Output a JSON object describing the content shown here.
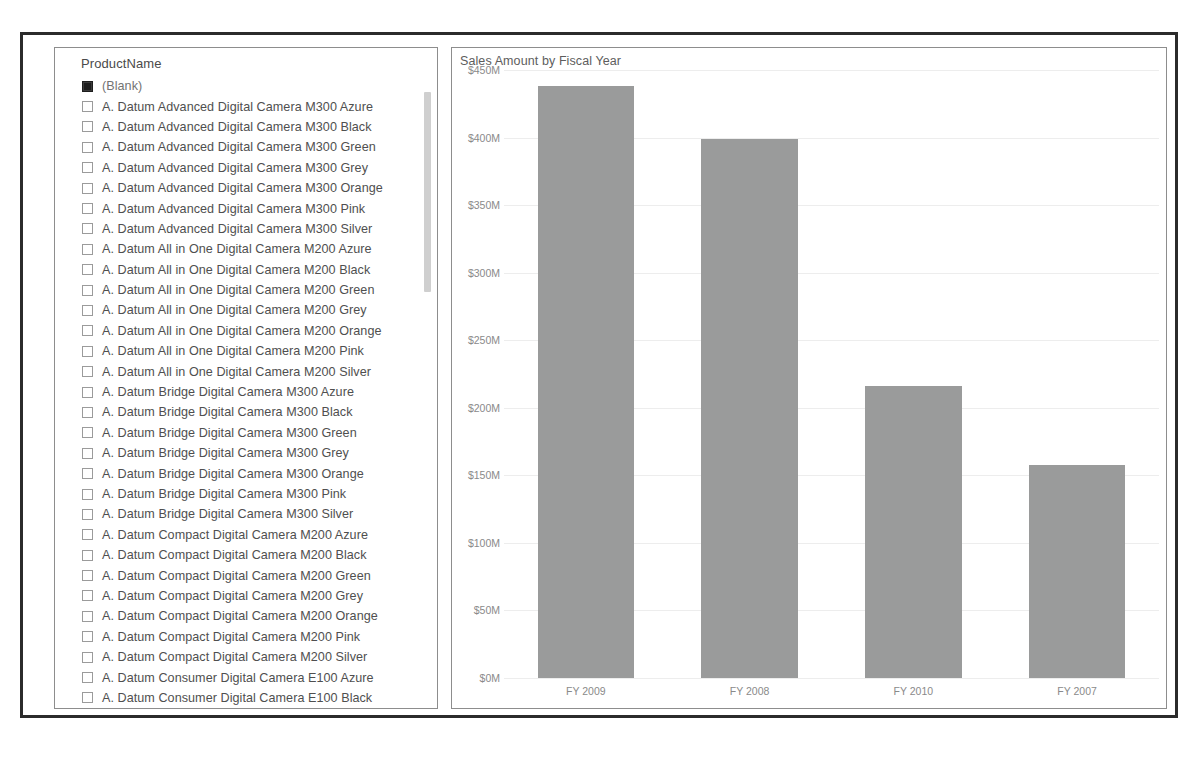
{
  "report": {
    "slicer": {
      "header": "ProductName",
      "scrollbar_name": "vertical-scrollbar",
      "items": [
        {
          "label": "(Blank)",
          "checked": true
        },
        {
          "label": "A. Datum Advanced Digital Camera M300 Azure",
          "checked": false
        },
        {
          "label": "A. Datum Advanced Digital Camera M300 Black",
          "checked": false
        },
        {
          "label": "A. Datum Advanced Digital Camera M300 Green",
          "checked": false
        },
        {
          "label": "A. Datum Advanced Digital Camera M300 Grey",
          "checked": false
        },
        {
          "label": "A. Datum Advanced Digital Camera M300 Orange",
          "checked": false
        },
        {
          "label": "A. Datum Advanced Digital Camera M300 Pink",
          "checked": false
        },
        {
          "label": "A. Datum Advanced Digital Camera M300 Silver",
          "checked": false
        },
        {
          "label": "A. Datum All in One Digital Camera M200 Azure",
          "checked": false
        },
        {
          "label": "A. Datum All in One Digital Camera M200 Black",
          "checked": false
        },
        {
          "label": "A. Datum All in One Digital Camera M200 Green",
          "checked": false
        },
        {
          "label": "A. Datum All in One Digital Camera M200 Grey",
          "checked": false
        },
        {
          "label": "A. Datum All in One Digital Camera M200 Orange",
          "checked": false
        },
        {
          "label": "A. Datum All in One Digital Camera M200 Pink",
          "checked": false
        },
        {
          "label": "A. Datum All in One Digital Camera M200 Silver",
          "checked": false
        },
        {
          "label": "A. Datum Bridge Digital Camera M300 Azure",
          "checked": false
        },
        {
          "label": "A. Datum Bridge Digital Camera M300 Black",
          "checked": false
        },
        {
          "label": "A. Datum Bridge Digital Camera M300 Green",
          "checked": false
        },
        {
          "label": "A. Datum Bridge Digital Camera M300 Grey",
          "checked": false
        },
        {
          "label": "A. Datum Bridge Digital Camera M300 Orange",
          "checked": false
        },
        {
          "label": "A. Datum Bridge Digital Camera M300 Pink",
          "checked": false
        },
        {
          "label": "A. Datum Bridge Digital Camera M300 Silver",
          "checked": false
        },
        {
          "label": "A. Datum Compact Digital Camera M200 Azure",
          "checked": false
        },
        {
          "label": "A. Datum Compact Digital Camera M200 Black",
          "checked": false
        },
        {
          "label": "A. Datum Compact Digital Camera M200 Green",
          "checked": false
        },
        {
          "label": "A. Datum Compact Digital Camera M200 Grey",
          "checked": false
        },
        {
          "label": "A. Datum Compact Digital Camera M200 Orange",
          "checked": false
        },
        {
          "label": "A. Datum Compact Digital Camera M200 Pink",
          "checked": false
        },
        {
          "label": "A. Datum Compact Digital Camera M200 Silver",
          "checked": false
        },
        {
          "label": "A. Datum Consumer Digital Camera E100 Azure",
          "checked": false
        },
        {
          "label": "A. Datum Consumer Digital Camera E100 Black",
          "checked": false
        },
        {
          "label": "A. Datum Consumer Digital Camera E100 Green",
          "checked": false
        }
      ]
    }
  },
  "colors": {
    "bar_fill": "#9a9b9b",
    "gridline": "#ededed",
    "axis_text": "#8a8a8a",
    "panel_border": "#8d8d8d",
    "frame_border": "#2b2b2b",
    "checkbox_checked": "#1d1d1d"
  },
  "chart_data": {
    "type": "bar",
    "title": "Sales Amount by Fiscal Year",
    "xlabel": "",
    "ylabel": "",
    "categories": [
      "FY 2009",
      "FY 2008",
      "FY 2010",
      "FY 2007"
    ],
    "values": [
      438,
      399,
      216,
      158
    ],
    "value_unit": "$M",
    "ylim": [
      0,
      450
    ],
    "ytick_values": [
      0,
      50,
      100,
      150,
      200,
      250,
      300,
      350,
      400,
      450
    ],
    "ytick_labels": [
      "$0M",
      "$50M",
      "$100M",
      "$150M",
      "$200M",
      "$250M",
      "$300M",
      "$350M",
      "$400M",
      "$450M"
    ],
    "grid": true,
    "legend": false,
    "orientation": "vertical"
  }
}
